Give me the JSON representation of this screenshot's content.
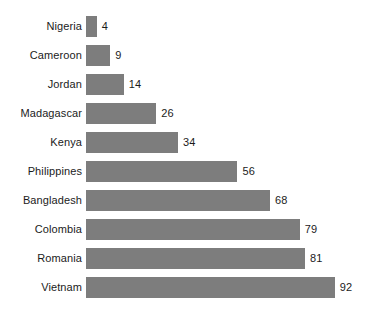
{
  "chart_data": {
    "type": "bar",
    "orientation": "horizontal",
    "title": "",
    "subtitle": "",
    "xlabel": "",
    "ylabel": "",
    "grid": false,
    "legend": false,
    "axis_visible": false,
    "value_labels_shown": true,
    "categories": [
      "Nigeria",
      "Cameroon",
      "Jordan",
      "Madagascar",
      "Kenya",
      "Philippines",
      "Bangladesh",
      "Colombia",
      "Romania",
      "Vietnam"
    ],
    "values": [
      4,
      9,
      14,
      26,
      34,
      56,
      68,
      79,
      81,
      92
    ],
    "xlim": [
      0,
      92
    ],
    "bar_color": "#7d7d7d",
    "text_color": "#1b1b1b",
    "background_color": "#ffffff",
    "points": [
      {
        "category": "Nigeria",
        "value": 4,
        "value_label": "4"
      },
      {
        "category": "Cameroon",
        "value": 9,
        "value_label": "9"
      },
      {
        "category": "Jordan",
        "value": 14,
        "value_label": "14"
      },
      {
        "category": "Madagascar",
        "value": 26,
        "value_label": "26"
      },
      {
        "category": "Kenya",
        "value": 34,
        "value_label": "34"
      },
      {
        "category": "Philippines",
        "value": 56,
        "value_label": "56"
      },
      {
        "category": "Bangladesh",
        "value": 68,
        "value_label": "68"
      },
      {
        "category": "Colombia",
        "value": 79,
        "value_label": "79"
      },
      {
        "category": "Romania",
        "value": 81,
        "value_label": "81"
      },
      {
        "category": "Vietnam",
        "value": 92,
        "value_label": "92"
      }
    ]
  },
  "layout": {
    "bar_origin_x": 86,
    "px_per_unit": 2.705,
    "row_top": 16,
    "row_pitch": 29,
    "bar_height": 21,
    "value_gap": 5
  }
}
